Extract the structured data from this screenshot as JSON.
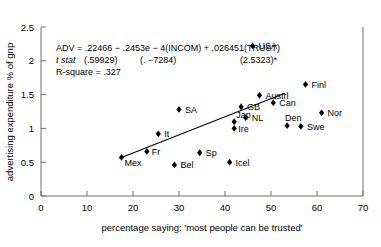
{
  "chart_data": {
    "type": "scatter",
    "title": "",
    "xlabel": "percentage saying: 'most people can be trusted'",
    "ylabel": "advertising expenditure % of gnp",
    "xlim": [
      0,
      70
    ],
    "ylim": [
      0,
      2.5
    ],
    "xticks": [
      "0",
      "10",
      "20",
      "30",
      "40",
      "50",
      "60",
      "70"
    ],
    "xtick_values": [
      0,
      10,
      20,
      30,
      40,
      50,
      60,
      70
    ],
    "yticks": [
      "0",
      "0.5",
      "1",
      "1.5",
      "2",
      "2.5"
    ],
    "ytick_values": [
      0,
      0.5,
      1,
      1.5,
      2,
      2.5
    ],
    "grid": false,
    "legend": "none",
    "points": [
      {
        "label": "USA",
        "x": 46.0,
        "y": 2.22,
        "label_dx": 6,
        "label_dy": 3.5
      },
      {
        "label": "Finl",
        "x": 57.5,
        "y": 1.65,
        "label_dx": 6,
        "label_dy": 3.5
      },
      {
        "label": "Austrl",
        "x": 47.5,
        "y": 1.49,
        "label_dx": 6,
        "label_dy": 3.5
      },
      {
        "label": "Can",
        "x": 50.5,
        "y": 1.38,
        "label_dx": 6,
        "label_dy": 3.5
      },
      {
        "label": "Nor",
        "x": 61.0,
        "y": 1.23,
        "label_dx": 6,
        "label_dy": 3.5
      },
      {
        "label": "GB",
        "x": 43.5,
        "y": 1.32,
        "label_dx": 6,
        "label_dy": 3.5
      },
      {
        "label": "SA",
        "x": 30.0,
        "y": 1.28,
        "label_dx": 6,
        "label_dy": 3.5
      },
      {
        "label": "NL",
        "x": 44.5,
        "y": 1.16,
        "label_dx": 6,
        "label_dy": 3.5
      },
      {
        "label": "Den",
        "x": 53.5,
        "y": 1.04,
        "label_dx": -2,
        "label_dy": -5
      },
      {
        "label": "Swe",
        "x": 56.5,
        "y": 1.03,
        "label_dx": 6,
        "label_dy": 3.5
      },
      {
        "label": "Jap",
        "x": 42.0,
        "y": 1.1,
        "label_dx": 2,
        "label_dy": -4
      },
      {
        "label": "Ire",
        "x": 42.0,
        "y": 1.0,
        "label_dx": 4,
        "label_dy": 3.5
      },
      {
        "label": "It",
        "x": 25.5,
        "y": 0.92,
        "label_dx": 6,
        "label_dy": 3.5
      },
      {
        "label": "Fr",
        "x": 23.0,
        "y": 0.66,
        "label_dx": 5,
        "label_dy": 4
      },
      {
        "label": "Mex",
        "x": 17.5,
        "y": 0.57,
        "label_dx": 3,
        "label_dy": 9
      },
      {
        "label": "Sp",
        "x": 34.5,
        "y": 0.64,
        "label_dx": 6,
        "label_dy": 3.5
      },
      {
        "label": "Icel",
        "x": 41.0,
        "y": 0.5,
        "label_dx": 6,
        "label_dy": 3.5
      },
      {
        "label": "Bel",
        "x": 29.0,
        "y": 0.46,
        "label_dx": 6,
        "label_dy": 3.5
      }
    ],
    "fit_line": {
      "x1": 17.5,
      "y1": 0.57,
      "x2": 53.0,
      "y2": 1.52
    },
    "annotation": {
      "line1": "ADV = .22466 − .2453e − 4(INCOM) + .026451(TRUST)",
      "line2_label": "t stat",
      "line2_v1": "(.59929)",
      "line2_v2": "(. −7284)",
      "line2_v3": "(2.5323)*",
      "line3": "R-square = .327"
    }
  }
}
